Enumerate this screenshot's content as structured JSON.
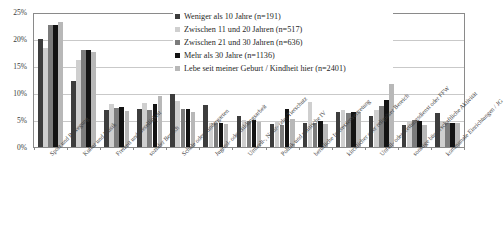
{
  "chart_data": {
    "type": "bar",
    "title": "",
    "xlabel": "",
    "ylabel": "",
    "ylim": [
      0,
      25
    ],
    "ytick_labels": [
      "0%",
      "5%",
      "10%",
      "15%",
      "20%",
      "25%"
    ],
    "ytick_values": [
      0,
      5,
      10,
      15,
      20,
      25
    ],
    "grid": true,
    "legend_position": "top-right",
    "categories": [
      "Sport und Bewegung",
      "Kultur und Musik",
      "Freizeit und Geselligkeit",
      "sozialer Bereich",
      "Schule oder Kindergarten",
      "Jugend- oder Bildungsarbeit",
      "Umwelt-, Natur- oder Tierschutz",
      "Politik und politische IV",
      "berufliche Interessenvertretung",
      "kirchlicher oder religiöser Bereich",
      "Unfall- oder Rettungsdienst oder FFW",
      "sonstige bürgerschaftliche Aktivität",
      "kommunale Einrichtungen / JG"
    ],
    "series": [
      {
        "name": "Weniger als 10 Jahre (n=191)",
        "color": "#3d3d3d",
        "values": [
          20.3,
          12.5,
          6.9,
          7.2,
          10.0,
          7.9,
          5.9,
          4.3,
          4.6,
          6.5,
          5.8,
          4.1,
          6.4
        ]
      },
      {
        "name": "Zwischen 11 und 20 Jahren (n=517)",
        "color": "#cfcfcf",
        "values": [
          18.6,
          16.3,
          8.0,
          8.2,
          8.6,
          4.6,
          5.1,
          4.7,
          8.5,
          6.9,
          7.0,
          4.7,
          4.7
        ]
      },
      {
        "name": "Zwischen 21 und 30 Jahren (n=636)",
        "color": "#7c7c7c",
        "values": [
          22.9,
          18.2,
          7.4,
          6.9,
          7.2,
          4.5,
          4.9,
          4.2,
          4.5,
          6.4,
          7.8,
          5.1,
          4.6
        ]
      },
      {
        "name": "Mehr als 30 Jahre (n=1136)",
        "color": "#131313",
        "values": [
          22.9,
          18.2,
          7.5,
          8.1,
          7.2,
          4.5,
          5.0,
          7.1,
          4.9,
          6.6,
          8.9,
          4.9,
          4.5
        ]
      },
      {
        "name": "Lebe seit meiner Geburt / Kindheit hier (n=2401)",
        "color": "#b8b8b8",
        "values": [
          23.5,
          17.8,
          6.8,
          9.6,
          6.5,
          4.4,
          4.7,
          5.3,
          4.4,
          6.6,
          11.8,
          4.2,
          4.6
        ]
      }
    ]
  }
}
